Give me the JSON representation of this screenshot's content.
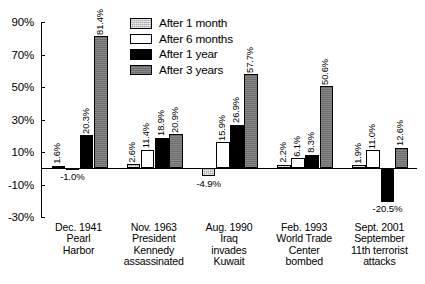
{
  "chart_data": {
    "type": "bar",
    "title": "",
    "xlabel": "",
    "ylabel": "",
    "ylim": [
      -30,
      90
    ],
    "ytick_labels": [
      "90%",
      "70%",
      "50%",
      "30%",
      "10%",
      "-10%",
      "-30%"
    ],
    "ytick_values": [
      90,
      70,
      50,
      30,
      10,
      -10,
      -30
    ],
    "grid": false,
    "legend_position": "top-center",
    "categories": [
      "Dec. 1941 Pearl Harbor",
      "Nov. 1963 President Kennedy assassinated",
      "Aug. 1990 Iraq invades Kuwait",
      "Feb. 1993 World Trade Center bombed",
      "Sept. 2001 September 11th terrorist attacks"
    ],
    "category_lines": [
      [
        "Dec. 1941",
        "Pearl",
        "Harbor"
      ],
      [
        "Nov. 1963",
        "President",
        "Kennedy",
        "assassinated"
      ],
      [
        "Aug. 1990",
        "Iraq",
        "invades",
        "Kuwait"
      ],
      [
        "Feb. 1993",
        "World Trade",
        "Center",
        "bombed"
      ],
      [
        "Sept. 2001",
        "September",
        "11th terrorist",
        "attacks"
      ]
    ],
    "series": [
      {
        "name": "After 1 month",
        "color": "#a8a8a8",
        "values": [
          1.6,
          2.6,
          -4.9,
          2.2,
          1.9
        ],
        "labels": [
          "1.6%",
          "2.6%",
          "-4.9%",
          "2.2%",
          "1.9%"
        ]
      },
      {
        "name": "After 6 months",
        "color": "#ffffff",
        "values": [
          -1.0,
          11.4,
          15.9,
          6.1,
          11.0
        ],
        "labels": [
          "-1.0%",
          "11.4%",
          "15.9%",
          "6.1%",
          "11.0%"
        ]
      },
      {
        "name": "After 1 year",
        "color": "#000000",
        "values": [
          20.3,
          18.9,
          26.9,
          8.3,
          -20.5
        ],
        "labels": [
          "20.3%",
          "18.9%",
          "26.9%",
          "8.3%",
          "-20.5%"
        ]
      },
      {
        "name": "After 3 years",
        "color": "#6e6e6e",
        "values": [
          81.4,
          20.9,
          57.7,
          50.6,
          12.6
        ],
        "labels": [
          "81.4%",
          "20.9%",
          "57.7%",
          "50.6%",
          "12.6%"
        ]
      }
    ]
  },
  "legend": {
    "items": [
      {
        "label": "After 1 month"
      },
      {
        "label": "After 6 months"
      },
      {
        "label": "After 1 year"
      },
      {
        "label": "After 3 years"
      }
    ]
  },
  "footnote": {
    "text": ""
  }
}
